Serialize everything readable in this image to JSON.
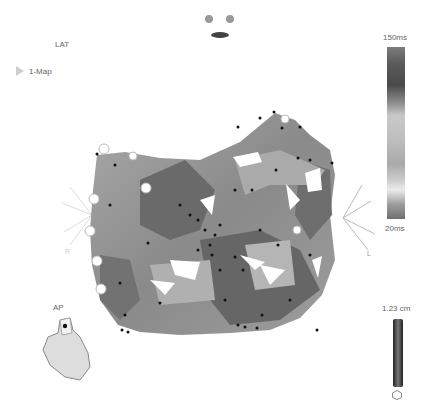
{
  "map": {
    "title": "LAT",
    "items": [
      {
        "label": "1-Map"
      }
    ]
  },
  "colorbar": {
    "max_label": "150ms",
    "min_label": "20ms"
  },
  "orientation": {
    "view_label": "AP",
    "right_axis_label": "L",
    "left_axis_label": "R"
  },
  "scale": {
    "label": "1.23 cm"
  },
  "colors": {
    "surface_dark": "#5e5e5e",
    "surface_mid": "#8c8c8c",
    "surface_light": "#b4b4b4",
    "point": "#111111"
  }
}
